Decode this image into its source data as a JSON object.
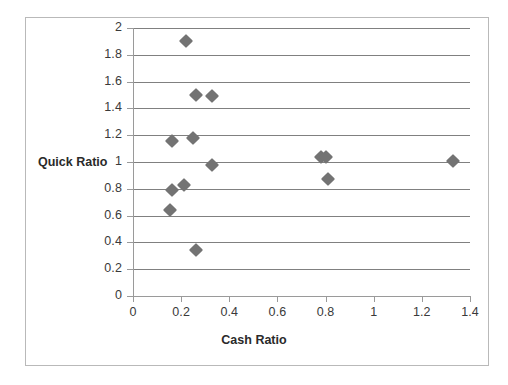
{
  "chart_data": {
    "type": "scatter",
    "title": "",
    "xlabel": "Cash Ratio",
    "ylabel": "Quick Ratio",
    "xlim": [
      0,
      1.4
    ],
    "ylim": [
      0,
      2
    ],
    "xticks": [
      "0",
      "0.2",
      "0.4",
      "0.6",
      "0.8",
      "1",
      "1.2",
      "1.4"
    ],
    "xtick_values": [
      0,
      0.2,
      0.4,
      0.6,
      0.8,
      1,
      1.2,
      1.4
    ],
    "yticks": [
      "0",
      "0.2",
      "0.4",
      "0.6",
      "0.8",
      "1",
      "1.2",
      "1.4",
      "1.6",
      "1.8",
      "2"
    ],
    "ytick_values": [
      0,
      0.2,
      0.4,
      0.6,
      0.8,
      1,
      1.2,
      1.4,
      1.6,
      1.8,
      2
    ],
    "grid": "horizontal",
    "legend": "none",
    "marker": "diamond",
    "marker_color": "#737373",
    "series": [
      {
        "name": "Cash Ratio vs Quick Ratio",
        "points": [
          {
            "x": 0.22,
            "y": 1.9
          },
          {
            "x": 0.26,
            "y": 1.5
          },
          {
            "x": 0.33,
            "y": 1.49
          },
          {
            "x": 0.16,
            "y": 1.16
          },
          {
            "x": 0.25,
            "y": 1.18
          },
          {
            "x": 0.33,
            "y": 0.98
          },
          {
            "x": 0.78,
            "y": 1.04
          },
          {
            "x": 0.8,
            "y": 1.04
          },
          {
            "x": 1.33,
            "y": 1.01
          },
          {
            "x": 0.81,
            "y": 0.87
          },
          {
            "x": 0.16,
            "y": 0.79
          },
          {
            "x": 0.21,
            "y": 0.83
          },
          {
            "x": 0.155,
            "y": 0.64
          },
          {
            "x": 0.26,
            "y": 0.34
          }
        ]
      }
    ]
  },
  "axis_titles": {
    "x": "Cash Ratio",
    "y": "Quick Ratio"
  }
}
